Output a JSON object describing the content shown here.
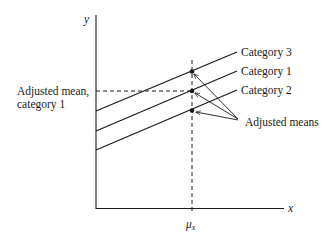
{
  "diagram": {
    "type": "ancova-adjusted-means",
    "axes": {
      "y_label": "y",
      "x_label": "x",
      "x_tick_label": "μ",
      "x_tick_subscript": "x"
    },
    "lines": [
      {
        "name": "Category 3",
        "label": "Category 3",
        "position": "top"
      },
      {
        "name": "Category 1",
        "label": "Category 1",
        "position": "middle"
      },
      {
        "name": "Category 2",
        "label": "Category 2",
        "position": "bottom"
      }
    ],
    "annotations": {
      "left_label_line1": "Adjusted mean,",
      "left_label_line2": "category 1",
      "arrows_label": "Adjusted means"
    },
    "colors": {
      "ink": "#1a1a1a",
      "background": "#ffffff"
    }
  }
}
